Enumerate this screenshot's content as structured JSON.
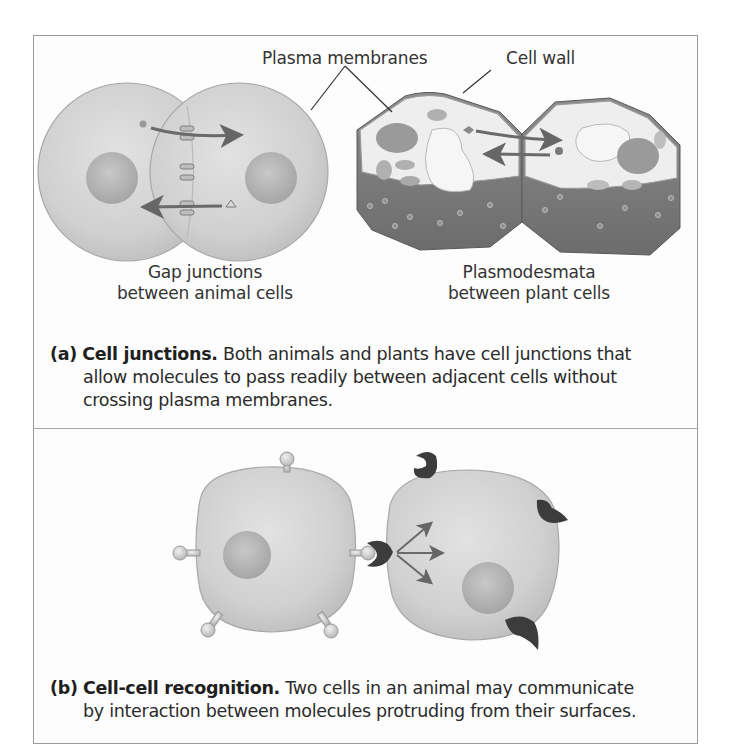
{
  "figure": {
    "panel_a": {
      "callouts": {
        "plasma_membranes": "Plasma membranes",
        "cell_wall": "Cell wall"
      },
      "animal_label_line1": "Gap junctions",
      "animal_label_line2": "between animal cells",
      "plant_label_line1": "Plasmodesmata",
      "plant_label_line2": "between plant cells",
      "caption": {
        "tag": "(a)",
        "title": "Cell junctions.",
        "line1": " Both animals and plants have cell junctions that",
        "line2": "allow molecules to pass readily between adjacent cells without",
        "line3": "crossing plasma membranes."
      }
    },
    "panel_b": {
      "caption": {
        "tag": "(b)",
        "title": "Cell-cell recognition.",
        "line1": " Two cells in an animal may communicate",
        "line2": "by interaction between molecules protruding from their surfaces."
      }
    },
    "colors": {
      "cell_fill": "#cfcfcf",
      "cell_edge": "#a9a9a9",
      "nucleus": "#b3b3b3",
      "plant_wall_dark": "#7a7a7a",
      "plant_interior": "#ececec",
      "arrow": "#6a6a6a",
      "receptor": "#3c3c3c",
      "frame": "#9a9a9a"
    }
  }
}
